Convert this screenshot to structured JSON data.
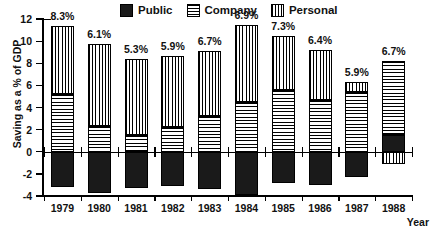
{
  "chart_data": {
    "type": "bar",
    "title": "",
    "subtype": "stacked-bar-with-negative",
    "xlabel": "Year",
    "ylabel": "Saving as a % of GDP",
    "categories": [
      "1979",
      "1980",
      "1981",
      "1982",
      "1983",
      "1984",
      "1985",
      "1986",
      "1987",
      "1988"
    ],
    "ylim": [
      -4,
      12
    ],
    "ytick_values": [
      12,
      10,
      8,
      6,
      4,
      2,
      0,
      -2,
      -4
    ],
    "ytick_labels": [
      "12",
      "10",
      "8",
      "6",
      "4",
      "2",
      "0",
      "-2",
      "-4"
    ],
    "grid": false,
    "legend_position": "top-center",
    "series": [
      {
        "name": "Public",
        "pattern": "solid-black",
        "color": "#1a1a1a",
        "values": [
          -3.2,
          -3.7,
          -3.3,
          -3.1,
          -3.4,
          -3.9,
          -2.8,
          -3.0,
          -2.3,
          1.5
        ]
      },
      {
        "name": "Company",
        "pattern": "horizontal-lines",
        "color": "#ffffff",
        "values": [
          5.2,
          2.3,
          1.5,
          2.2,
          3.2,
          4.5,
          5.6,
          4.7,
          5.4,
          6.7
        ]
      },
      {
        "name": "Personal",
        "pattern": "vertical-lines",
        "color": "#ffffff",
        "values": [
          6.2,
          7.4,
          6.9,
          6.5,
          5.9,
          7.0,
          4.9,
          4.5,
          0.9,
          -1.1
        ]
      }
    ],
    "annotations": [
      {
        "category": "1979",
        "label": "8.3%",
        "value": 8.3
      },
      {
        "category": "1980",
        "label": "6.1%",
        "value": 6.1
      },
      {
        "category": "1981",
        "label": "5.3%",
        "value": 5.3
      },
      {
        "category": "1982",
        "label": "5.9%",
        "value": 5.9
      },
      {
        "category": "1983",
        "label": "6.7%",
        "value": 6.7
      },
      {
        "category": "1984",
        "label": "6.9%",
        "value": 6.9
      },
      {
        "category": "1985",
        "label": "7.3%",
        "value": 7.3
      },
      {
        "category": "1986",
        "label": "6.4%",
        "value": 6.4
      },
      {
        "category": "1987",
        "label": "5.9%",
        "value": 5.9
      },
      {
        "category": "1988",
        "label": "6.7%",
        "value": 6.7
      }
    ]
  },
  "legend": {
    "items": [
      {
        "label": "Public",
        "icon": "solid-square-swatch"
      },
      {
        "label": "Company",
        "icon": "horizontal-stripe-swatch"
      },
      {
        "label": "Personal",
        "icon": "vertical-stripe-swatch"
      }
    ]
  },
  "axes": {
    "y_title": "Saving as a % of GDP",
    "x_title": "Year"
  }
}
